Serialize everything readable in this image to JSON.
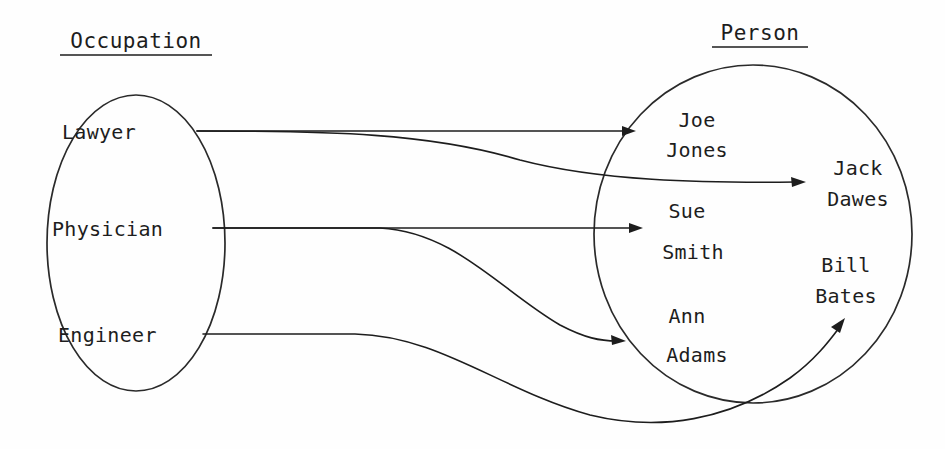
{
  "diagram": {
    "kind": "mapping-diagram",
    "left_set": {
      "title": "Occupation",
      "members": [
        {
          "id": "lawyer",
          "label": "Lawyer"
        },
        {
          "id": "physician",
          "label": "Physician"
        },
        {
          "id": "engineer",
          "label": "Engineer"
        }
      ]
    },
    "right_set": {
      "title": "Person",
      "members": [
        {
          "id": "joe-jones",
          "line1": "Joe",
          "line2": "Jones"
        },
        {
          "id": "jack-dawes",
          "line1": "Jack",
          "line2": "Dawes"
        },
        {
          "id": "sue-smith",
          "line1": "Sue",
          "line2": "Smith"
        },
        {
          "id": "bill-bates",
          "line1": "Bill",
          "line2": "Bates"
        },
        {
          "id": "ann-adams",
          "line1": "Ann",
          "line2": "Adams"
        }
      ]
    },
    "edges": [
      {
        "id": "lawyer-to-joe-jones",
        "from": "Lawyer",
        "to": "Joe Jones"
      },
      {
        "id": "lawyer-to-jack-dawes",
        "from": "Lawyer",
        "to": "Jack Dawes"
      },
      {
        "id": "physician-to-sue-smith",
        "from": "Physician",
        "to": "Sue Smith"
      },
      {
        "id": "physician-to-ann-adams",
        "from": "Physician",
        "to": "Ann Adams"
      },
      {
        "id": "engineer-to-bill-bates",
        "from": "Engineer",
        "to": "Bill Bates"
      }
    ],
    "colors": {
      "ink": "#1d1d1d",
      "stroke": "#2a2a2a",
      "background": "#fefefe"
    }
  }
}
